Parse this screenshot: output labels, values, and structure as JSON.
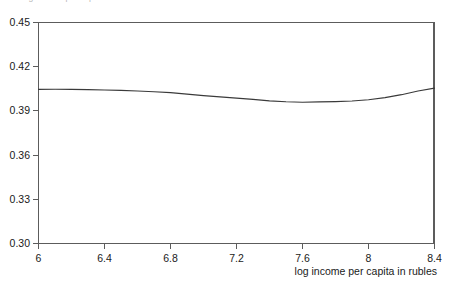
{
  "figure": {
    "clipped_caption": "log income per capita"
  },
  "chart_data": {
    "type": "line",
    "title": "",
    "xlabel": "log income per capita in rubles",
    "ylabel": "",
    "xlim": [
      6,
      8.4
    ],
    "ylim": [
      0.3,
      0.45
    ],
    "grid": false,
    "legend": "none",
    "xticks": [
      "6",
      "6.4",
      "6.8",
      "7.2",
      "7.6",
      "8",
      "8.4"
    ],
    "xtick_values": [
      6,
      6.4,
      6.8,
      7.2,
      7.6,
      8,
      8.4
    ],
    "yticks": [
      "0.30",
      "0.33",
      "0.36",
      "0.39",
      "0.42",
      "0.45"
    ],
    "ytick_values": [
      0.3,
      0.33,
      0.36,
      0.39,
      0.42,
      0.45
    ],
    "series": [
      {
        "name": "estimate",
        "color": "#3a3a3a",
        "x": [
          6.0,
          6.1,
          6.2,
          6.3,
          6.4,
          6.5,
          6.6,
          6.7,
          6.8,
          6.9,
          7.0,
          7.1,
          7.2,
          7.3,
          7.4,
          7.5,
          7.6,
          7.7,
          7.8,
          7.9,
          8.0,
          8.1,
          8.2,
          8.3,
          8.4
        ],
        "y": [
          0.4046,
          0.4047,
          0.4046,
          0.4044,
          0.4042,
          0.4039,
          0.4035,
          0.403,
          0.4024,
          0.4014,
          0.4004,
          0.3995,
          0.3987,
          0.3978,
          0.3968,
          0.3962,
          0.3959,
          0.3961,
          0.3963,
          0.3967,
          0.3976,
          0.399,
          0.401,
          0.4035,
          0.4055
        ]
      }
    ]
  }
}
